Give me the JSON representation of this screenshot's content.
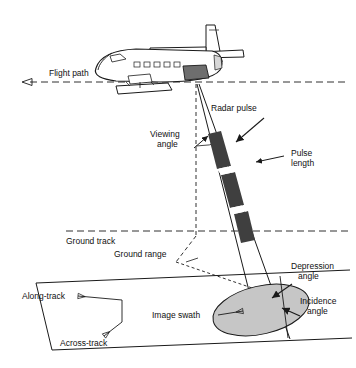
{
  "figure": {
    "type": "side-looking-radar-geometry-diagram",
    "background_color": "#ffffff",
    "line_color": "#1a1a1a",
    "swath_fill": "#c9c9c9",
    "pulse_fill": "#3a3a3a"
  },
  "labels": {
    "flight_path": "Flight path",
    "radar_pulse": "Radar pulse",
    "viewing_angle_l1": "Viewing",
    "viewing_angle_l2": "angle",
    "pulse_length_l1": "Pulse",
    "pulse_length_l2": "length",
    "ground_track": "Ground track",
    "ground_range": "Ground range",
    "depression_angle_l1": "Depression",
    "depression_angle_l2": "angle",
    "incidence_angle_l1": "Incidence",
    "incidence_angle_l2": "angle",
    "along_track": "Along-track",
    "across_track": "Across-track",
    "image_swath": "Image swath"
  }
}
